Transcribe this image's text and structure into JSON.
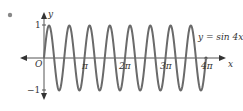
{
  "bullet": "•",
  "chart_data": {
    "type": "line",
    "title": "",
    "equation_label": "y = sin 4x",
    "xlabel": "x",
    "ylabel": "y",
    "origin_label": "O",
    "x_ticks": [
      "π",
      "2π",
      "3π",
      "4π"
    ],
    "y_ticks": [
      "1",
      "−1"
    ],
    "xlim": [
      -0.6,
      4.5
    ],
    "ylim": [
      -1.2,
      1.2
    ],
    "series": [
      {
        "name": "y = sin 4x",
        "function": "sin(4x)",
        "x_range": [
          0,
          "4π"
        ],
        "color": "#666666"
      }
    ],
    "grid": false
  }
}
